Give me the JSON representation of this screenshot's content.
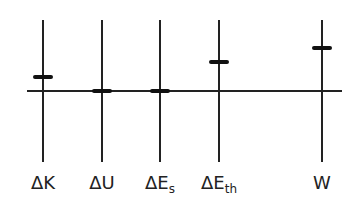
{
  "chart_data": {
    "type": "bar",
    "title": "",
    "xlabel": "",
    "ylabel": "",
    "categories": [
      "ΔK",
      "ΔU",
      "ΔEs",
      "ΔEth",
      "W"
    ],
    "values": [
      1,
      0,
      0,
      2,
      3
    ],
    "units": "relative (energy bar chart, no numeric scale shown)",
    "grid": false,
    "legend": null
  },
  "columns": [
    {
      "key": "dK",
      "symbol": "ΔK",
      "sub": "",
      "x": 43,
      "value": 1
    },
    {
      "key": "dU",
      "symbol": "ΔU",
      "sub": "",
      "x": 102,
      "value": 0
    },
    {
      "key": "dEs",
      "symbol": "ΔE",
      "sub": "s",
      "x": 160,
      "value": 0
    },
    {
      "key": "dEth",
      "symbol": "ΔE",
      "sub": "th",
      "x": 219,
      "value": 2
    },
    {
      "key": "W",
      "symbol": "W",
      "sub": "",
      "x": 322,
      "value": 3
    }
  ],
  "layout": {
    "baseline_y": 91,
    "unit_px": 14.5
  }
}
